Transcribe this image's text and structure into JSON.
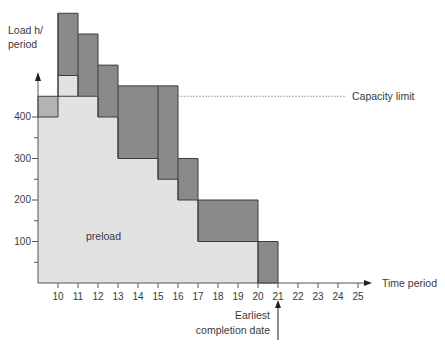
{
  "chart_data": {
    "type": "bar",
    "subtype": "stacked-step",
    "title": "",
    "ylabel": "Load h/ period",
    "xlabel": "Time period",
    "xlim": [
      9,
      25
    ],
    "ylim": [
      0,
      650
    ],
    "x_ticks": [
      10,
      11,
      12,
      13,
      14,
      15,
      16,
      17,
      18,
      19,
      20,
      21,
      22,
      23,
      24,
      25
    ],
    "y_ticks": [
      100,
      200,
      300,
      400
    ],
    "y_minor_ticks": [
      50,
      150,
      250,
      350
    ],
    "grid": false,
    "capacity_limit": 450,
    "capacity_label": "Capacity limit",
    "preload_label": "preload",
    "earliest_completion": {
      "period": 21,
      "label_line1": "Earliest",
      "label_line2": "completion date"
    },
    "segments": [
      {
        "from": 9,
        "to": 10,
        "preload": 400,
        "total": 450,
        "style": "medium"
      },
      {
        "from": 10,
        "to": 11,
        "preload": 500,
        "total": 650,
        "style": "dark"
      },
      {
        "from": 11,
        "to": 12,
        "preload": 450,
        "total": 600,
        "style": "dark"
      },
      {
        "from": 12,
        "to": 13,
        "preload": 400,
        "total": 525,
        "style": "dark"
      },
      {
        "from": 13,
        "to": 15,
        "preload": 300,
        "total": 475,
        "style": "dark"
      },
      {
        "from": 15,
        "to": 16,
        "preload": 250,
        "total": 475,
        "style": "dark"
      },
      {
        "from": 16,
        "to": 17,
        "preload": 200,
        "total": 300,
        "style": "dark"
      },
      {
        "from": 17,
        "to": 20,
        "preload": 100,
        "total": 200,
        "style": "dark"
      },
      {
        "from": 20,
        "to": 21,
        "preload": 0,
        "total": 100,
        "style": "dark"
      }
    ],
    "series": [
      {
        "name": "preload",
        "color": "#e2e2e2"
      },
      {
        "name": "new order load",
        "color": "#8a8a8a"
      },
      {
        "name": "overload (period 9-10)",
        "color": "#b3b3b3"
      }
    ]
  },
  "colors": {
    "preload": "#e2e2e2",
    "dark": "#8a8a8a",
    "medium": "#b3b3b3",
    "stroke": "#3c3c3c",
    "axis": "#555555",
    "capacity_line": "#aaaaaa"
  },
  "labels": {
    "ylabel_line1": "Load h/",
    "ylabel_line2": "period",
    "xtitle": "Time period",
    "capacity": "Capacity limit",
    "preload": "preload",
    "earliest_line1": "Earliest",
    "earliest_line2": "completion date"
  }
}
